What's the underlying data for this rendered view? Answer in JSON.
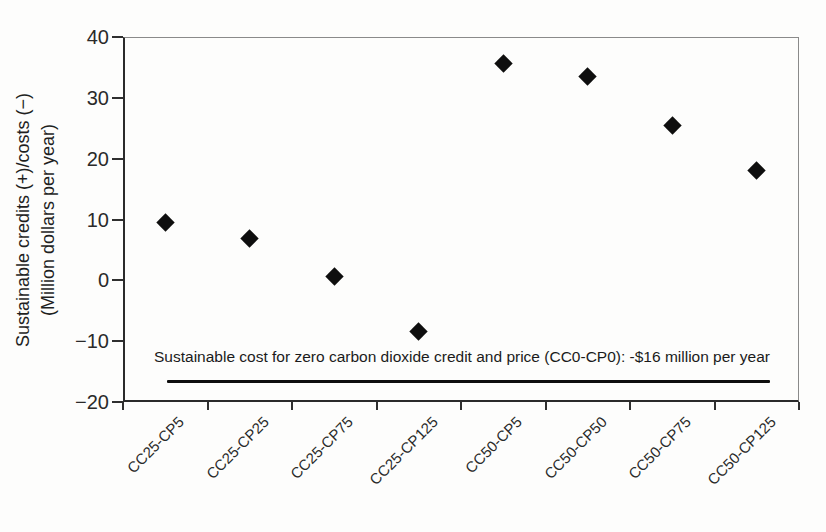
{
  "chart_data": {
    "type": "scatter",
    "title": "",
    "categories": [
      "CC25-CP5",
      "CC25-CP25",
      "CC25-CP75",
      "CC25-CP125",
      "CC50-CP5",
      "CC50-CP50",
      "CC50-CP75",
      "CC50-CP125"
    ],
    "values": [
      9.5,
      6.8,
      0.7,
      -8.4,
      35.7,
      33.5,
      25.4,
      18.1
    ],
    "xlabel": "",
    "ylabel_line1": "Sustainable credits (+)/costs (−)",
    "ylabel_line2": "(Million dollars per year)",
    "ylim": [
      -20,
      40
    ],
    "yticks": [
      40,
      30,
      20,
      10,
      0,
      -10,
      -20
    ],
    "ytick_labels": [
      "40",
      "30",
      "20",
      "10",
      "0",
      "−10",
      "−20"
    ],
    "grid": false,
    "legend": "none",
    "marker": {
      "shape": "diamond",
      "color": "#0e0e0e",
      "size_px": 13
    },
    "annotation": {
      "text": "Sustainable cost for zero carbon dioxide credit and price (CC0-CP0): -$16 million per year",
      "line_value": -16.5
    },
    "axis_color": "#2b2b2b",
    "background_color": "#fdfdfc"
  }
}
